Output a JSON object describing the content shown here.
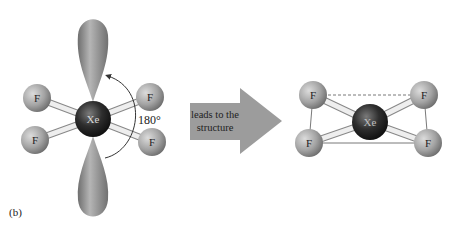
{
  "figure": {
    "panel_label": "(b)",
    "left_molecule": {
      "central_atom": "Xe",
      "ligands": [
        "F",
        "F",
        "F",
        "F"
      ],
      "angle_label": "180°",
      "lone_pair_lobes": 2
    },
    "arrow": {
      "line1": "leads to the",
      "line2": "structure"
    },
    "right_molecule": {
      "central_atom": "Xe",
      "ligands": [
        "F",
        "F",
        "F",
        "F"
      ],
      "geometry": "square planar"
    },
    "colors": {
      "ligand": "#a8a8a8",
      "central": "#2a2a2a",
      "lobe": "#8f8f8f",
      "arrow": "#9a9a9a",
      "bond": "#e0e0e0"
    }
  }
}
